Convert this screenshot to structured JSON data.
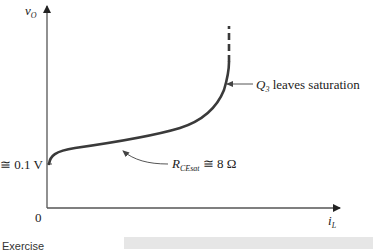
{
  "figure": {
    "y_axis_label": {
      "var": "v",
      "sub": "O"
    },
    "x_axis_label": {
      "var": "i",
      "sub": "L"
    },
    "origin_label": "0",
    "tick_label": "≅ 0.1 V",
    "annotations": {
      "rce": {
        "prefix": "R",
        "sub": "CEsat",
        "suffix": " ≅ 8 Ω"
      },
      "q3": {
        "prefix": "Q",
        "sub": "3",
        "suffix": " leaves saturation"
      }
    },
    "colors": {
      "curve": "#3a3a3a",
      "axis": "#555555",
      "arrow": "#555555"
    }
  },
  "bottom": {
    "heading_fragment": "Exercise",
    "bar_color": "#e6e6e6"
  }
}
